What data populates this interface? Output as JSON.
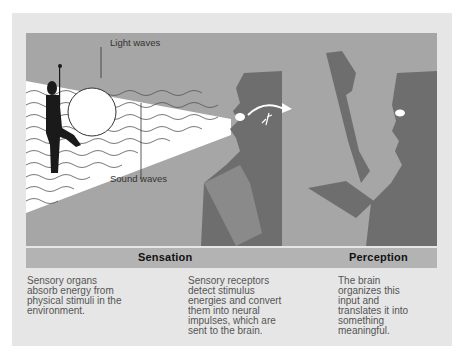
{
  "diagram": {
    "labels": {
      "light_waves": "Light waves",
      "sound_waves": "Sound waves"
    },
    "stages": [
      {
        "title": "Sensation"
      },
      {
        "title": "Perception"
      }
    ],
    "descriptions": [
      {
        "text": "Sensory organs\nabsorb energy from\nphysical stimuli in the\nenvironment."
      },
      {
        "text": "Sensory receptors\ndetect stimulus\nenergies and convert\nthem into neural\nimpulses, which are\nsent to the brain."
      },
      {
        "text": "The brain\norganizes this\ninput and\ntranslates it into\nsomething\nmeaningful."
      }
    ],
    "colors": {
      "frame_bg": "#e6e6e6",
      "illustration_bg": "#a6a6a6",
      "silhouette": "#6e6e6e",
      "band": "#b3b3b3",
      "cone": "#ffffff"
    }
  }
}
